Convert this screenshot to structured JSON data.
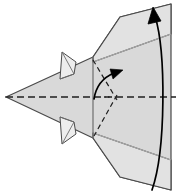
{
  "figure": {
    "name": "origami-step-diagram",
    "title": "Origami folding step diagram",
    "width": 176,
    "height": 196,
    "background_color": "#ffffff"
  },
  "colors": {
    "paper_fill_light": "#e2e2e2",
    "paper_fill_mid": "#d9d9d9",
    "paper_fill_dark": "#cfcfcf",
    "paper_fill_tab": "#ededed",
    "outline_stroke": "#4a4a4a",
    "crease_soft_stroke": "#b0b0b0",
    "dashed_stroke": "#1f1f1f",
    "arrow_stroke": "#000000"
  },
  "geometry": {
    "apex": {
      "x": 6,
      "y": 97
    },
    "vertical_crease": {
      "x": 93,
      "top_y": 57,
      "bottom_y": 138
    },
    "right_edge_x": 171,
    "center_axis_y": 97
  },
  "elements": {
    "body_panel": {
      "label": "main-paper-body",
      "points": "6,97 93,57 120,17 171,4 171,190 120,177 93,138"
    },
    "upper_wing": {
      "label": "upper-wing-panel",
      "points": "93,57 120,17 171,4 171,34 93,62"
    },
    "lower_wing": {
      "label": "lower-wing-panel",
      "points": "93,138 120,177 171,190 171,160 93,133"
    },
    "top_tab": {
      "label": "upper-pleat-tab",
      "outline": "60,79 62,52 76,62 74,74",
      "inner": "62,52 74,74 60,79"
    },
    "bottom_tab": {
      "label": "lower-pleat-tab",
      "outline": "60,117 62,144 76,134 74,122",
      "inner": "62,144 74,122 60,117"
    },
    "center_axis_dash": {
      "label": "horizontal-center-axis",
      "from_x": 6,
      "to_x": 176,
      "y": 97
    },
    "dashed_fold_upper": {
      "label": "dashed-fold-line-upper",
      "d": "M 93,60 L 117,100"
    },
    "dashed_fold_lower": {
      "label": "dashed-fold-line-lower",
      "d": "M 117,95 L 94,136"
    },
    "curved_arrow_small": {
      "label": "small-rotation-arrow",
      "path": "M 94,99 C 96,86 102,78 114,73",
      "head": "123,70 110,69 113,79"
    },
    "curved_arrow_large": {
      "label": "large-fold-over-arrow",
      "path": "M 152,190 C 166,150 166,52 155,16",
      "head": "153,7 148,24 161,21"
    },
    "soft_crease_upper": {
      "label": "soft-crease-upper",
      "d": "M 93,62 L 171,34"
    },
    "soft_crease_lower": {
      "label": "soft-crease-lower",
      "d": "M 93,133 L 171,160"
    }
  }
}
